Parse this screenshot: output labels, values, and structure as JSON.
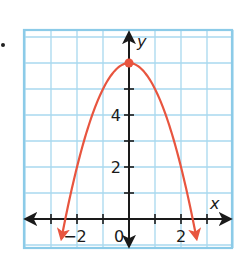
{
  "chart_data": {
    "type": "line",
    "title": "",
    "xlabel": "x",
    "ylabel": "y",
    "function": "y = -x^2 + 6",
    "xlim": [
      -4,
      4
    ],
    "ylim": [
      -1.1,
      7.2
    ],
    "grid": true,
    "x_tick_labels": [
      {
        "value": -2,
        "label": "−2"
      },
      {
        "value": 0,
        "label": "0"
      },
      {
        "value": 2,
        "label": "2"
      }
    ],
    "y_tick_labels": [
      {
        "value": 2,
        "label": "2"
      },
      {
        "value": 4,
        "label": "4"
      }
    ],
    "x_ticks": [
      -3,
      -2,
      -1,
      1,
      2,
      3
    ],
    "y_ticks": [
      1,
      2,
      3,
      4,
      5
    ],
    "vertex": {
      "x": 0,
      "y": 6
    },
    "curve_domain": [
      -2.6,
      2.6
    ],
    "series": [
      {
        "name": "parabola",
        "color": "#e8553f",
        "arrows_both_ends": true
      }
    ]
  },
  "colors": {
    "grid": "#a8d8ef",
    "border": "#8ccbe8",
    "axis": "#1a1a1a",
    "curve": "#e8553f"
  }
}
